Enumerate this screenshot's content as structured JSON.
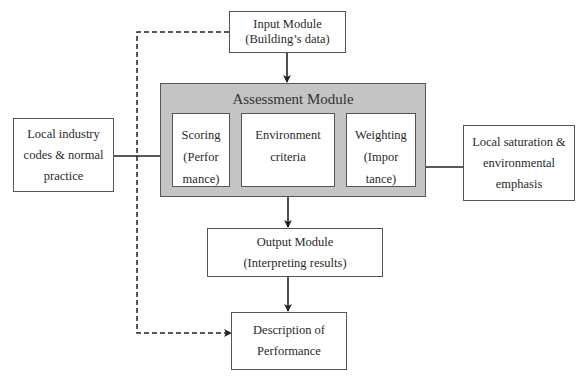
{
  "diagram": {
    "input_module": {
      "line1": "Input Module",
      "line2": "(Building’s data)"
    },
    "assessment_module": {
      "title": "Assessment Module",
      "scoring": {
        "line1": "Scoring",
        "line2": "(Perfor",
        "line3": "mance)"
      },
      "environment": {
        "line1": "Environment",
        "line2": "criteria"
      },
      "weighting": {
        "line1": "Weighting",
        "line2": "(Impor",
        "line3": "tance)"
      }
    },
    "left_input": {
      "line1": "Local industry",
      "line2": "codes & normal",
      "line3": "practice"
    },
    "right_input": {
      "line1": "Local saturation &",
      "line2": "environmental",
      "line3": "emphasis"
    },
    "output_module": {
      "line1": "Output Module",
      "line2": "(Interpreting results)"
    },
    "description": {
      "line1": "Description of",
      "line2": "Performance"
    },
    "colors": {
      "assessment_fill": "#c4c4c4",
      "stroke": "#555555",
      "arrow": "#222222"
    }
  }
}
